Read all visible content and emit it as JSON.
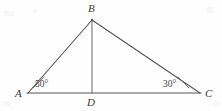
{
  "figure": {
    "kind": "geometry-diagram",
    "background_color": "#fefefe",
    "stroke_color": "#555555",
    "text_color": "#3a3a3a",
    "stroke_width": 1.1
  },
  "vertices": {
    "B": {
      "label": "B",
      "x": 92,
      "y": 20
    },
    "A": {
      "label": "A",
      "x": 28,
      "y": 93
    },
    "D": {
      "label": "D",
      "x": 92,
      "y": 93
    },
    "C": {
      "label": "C",
      "x": 200,
      "y": 93
    }
  },
  "segments": [
    {
      "name": "AB",
      "from": "A",
      "to": "B"
    },
    {
      "name": "BC",
      "from": "B",
      "to": "C"
    },
    {
      "name": "AC",
      "from": "A",
      "to": "C"
    },
    {
      "name": "BD",
      "from": "B",
      "to": "D"
    }
  ],
  "angles": {
    "at_A": {
      "label": "50°",
      "value": 50,
      "unit": "degrees",
      "vertex": "A"
    },
    "at_C": {
      "label": "30°",
      "value": 30,
      "unit": "degrees",
      "vertex": "C"
    }
  },
  "angle_marks": {
    "at_A": {
      "x1": 33,
      "y1": 88,
      "x2": 44,
      "y2": 77
    },
    "at_C": {
      "x1": 189,
      "y1": 88,
      "x2": 178,
      "y2": 77
    }
  }
}
